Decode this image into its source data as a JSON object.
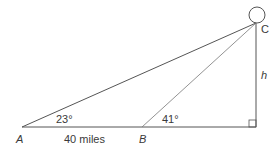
{
  "diagram": {
    "type": "trigonometry-triangle",
    "points": {
      "A": {
        "label": "A"
      },
      "B": {
        "label": "B"
      },
      "C": {
        "label": "C"
      }
    },
    "angles": {
      "at_A": "23°",
      "at_B": "41°"
    },
    "lengths": {
      "AB": "40 miles",
      "height": "h"
    },
    "right_angle_marker": true,
    "object_at_C": "circle"
  }
}
